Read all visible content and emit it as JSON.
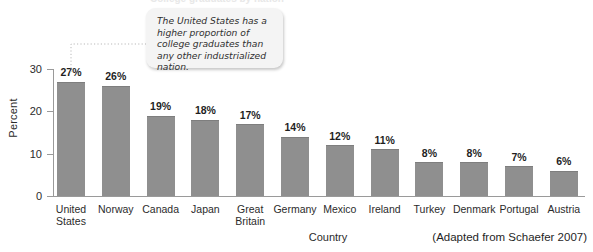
{
  "figure": {
    "clipped_title": "College graduates by nation",
    "callout_text": "The United States has a higher proportion of college graduates than any other industrialized nation.",
    "x_axis_title": "Country",
    "y_axis_title": "Percent",
    "source_note": "(Adapted from Schaefer 2007)",
    "bar_color": "#8f8f8f",
    "callout_background": "#f4f4f4",
    "axis_color": "#9a9a9a"
  },
  "chart_data": {
    "type": "bar",
    "title": "College graduates by nation",
    "xlabel": "Country",
    "ylabel": "Percent",
    "ylim": [
      0,
      30
    ],
    "yticks": [
      0,
      10,
      20,
      30
    ],
    "ytick_labels": [
      "0",
      "10",
      "20",
      "30"
    ],
    "grid": false,
    "legend": "none",
    "value_suffix": "%",
    "categories": [
      "United States",
      "Norway",
      "Canada",
      "Japan",
      "Great Britain",
      "Germany",
      "Mexico",
      "Ireland",
      "Turkey",
      "Denmark",
      "Portugal",
      "Austria"
    ],
    "category_lines": [
      [
        "United",
        "States"
      ],
      [
        "Norway"
      ],
      [
        "Canada"
      ],
      [
        "Japan"
      ],
      [
        "Great",
        "Britain"
      ],
      [
        "Germany"
      ],
      [
        "Mexico"
      ],
      [
        "Ireland"
      ],
      [
        "Turkey"
      ],
      [
        "Denmark"
      ],
      [
        "Portugal"
      ],
      [
        "Austria"
      ]
    ],
    "values": [
      27,
      26,
      19,
      18,
      17,
      14,
      12,
      11,
      8,
      8,
      7,
      6
    ],
    "data_labels": [
      "27%",
      "26%",
      "19%",
      "18%",
      "17%",
      "14%",
      "12%",
      "11%",
      "8%",
      "8%",
      "7%",
      "6%"
    ],
    "annotations": [
      {
        "text": "The United States has a higher proportion of college graduates than any other industrialized nation.",
        "points_to": "United States"
      }
    ]
  }
}
